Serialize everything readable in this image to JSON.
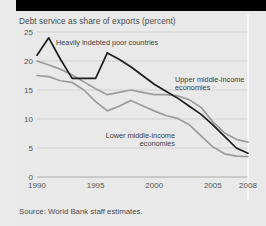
{
  "figure": {
    "title": "Debt service as share of exports (percent)",
    "source": "Source: World Bank staff estimates."
  },
  "annotations": {
    "hipc": "Heavily indebted poor countries",
    "upper_line1": "Upper middle-income",
    "upper_line2": "economies",
    "lower_line1": "Lower middle-income",
    "lower_line2": "economies"
  },
  "axis": {
    "y_ticks": [
      "25",
      "20",
      "15",
      "10",
      "5",
      "0"
    ],
    "x_ticks": [
      "1990",
      "1995",
      "2000",
      "2005",
      "2008"
    ]
  },
  "colors": {
    "background": "#e9e9e9",
    "dark_series": "#1d1d1d",
    "gray_series": "#9c9c9c",
    "grid": "#c9c9c9",
    "text": "#4a4a4a",
    "band": "#000000"
  },
  "chart_data": {
    "type": "line",
    "title": "Debt service as share of exports (percent)",
    "xlabel": "",
    "ylabel": "Debt service as share of exports (percent)",
    "xlim": [
      1990,
      2008
    ],
    "ylim": [
      0,
      25
    ],
    "ytick_values": [
      0,
      5,
      10,
      15,
      20,
      25
    ],
    "xtick_values": [
      1990,
      1995,
      2000,
      2005,
      2008
    ],
    "grid": true,
    "legend": "inline annotations",
    "x": [
      1990,
      1991,
      1992,
      1993,
      1994,
      1995,
      1996,
      1997,
      1998,
      1999,
      2000,
      2001,
      2002,
      2003,
      2004,
      2005,
      2006,
      2007,
      2008
    ],
    "series": [
      {
        "name": "Heavily indebted poor countries",
        "color": "#1d1d1d",
        "values": [
          21.0,
          24.0,
          20.3,
          17.0,
          17.0,
          17.0,
          21.4,
          20.3,
          19.0,
          17.5,
          16.0,
          14.8,
          13.6,
          12.2,
          10.8,
          9.0,
          7.0,
          5.0,
          4.1
        ]
      },
      {
        "name": "Upper middle-income economies",
        "color": "#9c9c9c",
        "values": [
          20.0,
          19.3,
          18.6,
          17.6,
          16.4,
          15.2,
          14.2,
          14.6,
          15.0,
          14.6,
          14.2,
          14.2,
          14.0,
          13.3,
          12.0,
          9.5,
          7.6,
          6.5,
          6.0
        ]
      },
      {
        "name": "Lower middle-income economies",
        "color": "#9c9c9c",
        "values": [
          17.5,
          17.3,
          16.6,
          16.3,
          15.0,
          13.0,
          11.4,
          12.2,
          13.2,
          12.3,
          11.4,
          10.6,
          10.1,
          9.0,
          7.1,
          5.2,
          4.0,
          3.6,
          3.5
        ]
      }
    ]
  }
}
